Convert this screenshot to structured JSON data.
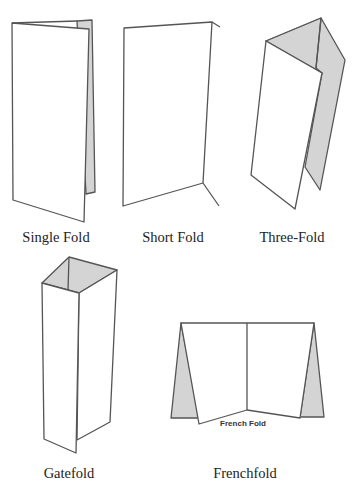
{
  "diagram": {
    "colors": {
      "line": "#555555",
      "shade": "#d4d4d4",
      "paper": "#ffffff",
      "text": "#222222"
    },
    "folds": [
      {
        "id": "single",
        "label": "Single Fold"
      },
      {
        "id": "short",
        "label": "Short Fold"
      },
      {
        "id": "three",
        "label": "Three-Fold"
      },
      {
        "id": "gate",
        "label": "Gatefold"
      },
      {
        "id": "french",
        "label": "Frenchfold",
        "inner_label": "French Fold"
      }
    ]
  }
}
